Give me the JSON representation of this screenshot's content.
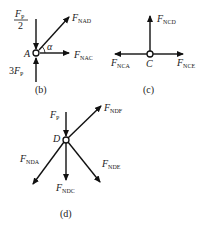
{
  "diagrams": [
    {
      "id": "b",
      "caption": "(b)",
      "node": {
        "label": "A"
      },
      "forces": [
        {
          "name": "F_P/2",
          "main": "F",
          "sub": "P",
          "numerator": "F",
          "numerator_sub": "P",
          "denominator": "2",
          "direction": "down",
          "into_node": true
        },
        {
          "name": "F_NAD",
          "main": "F",
          "sub": "NAD",
          "direction": "up-right",
          "into_node": false
        },
        {
          "name": "F_NAC",
          "main": "F",
          "sub": "NAC",
          "direction": "right",
          "into_node": false
        },
        {
          "name": "3F_P",
          "coef": "3",
          "main": "F",
          "sub": "P",
          "direction": "up",
          "into_node": true
        }
      ],
      "angle_label": "α"
    },
    {
      "id": "c",
      "caption": "(c)",
      "node": {
        "label": "C"
      },
      "forces": [
        {
          "name": "F_NCD",
          "main": "F",
          "sub": "NCD",
          "direction": "up"
        },
        {
          "name": "F_NCA",
          "main": "F",
          "sub": "NCA",
          "direction": "left"
        },
        {
          "name": "F_NCE",
          "main": "F",
          "sub": "NCE",
          "direction": "right"
        }
      ]
    },
    {
      "id": "d",
      "caption": "(d)",
      "node": {
        "label": "D"
      },
      "forces": [
        {
          "name": "F_P",
          "main": "F",
          "sub": "P",
          "direction": "down",
          "into_node": true
        },
        {
          "name": "F_NDF",
          "main": "F",
          "sub": "NDF",
          "direction": "up-right"
        },
        {
          "name": "F_NDA",
          "main": "F",
          "sub": "NDA",
          "direction": "down-left"
        },
        {
          "name": "F_NDC",
          "main": "F",
          "sub": "NDC",
          "direction": "down"
        },
        {
          "name": "F_NDE",
          "main": "F",
          "sub": "NDE",
          "direction": "down-right"
        }
      ]
    }
  ],
  "colors": {
    "stroke": "#111111",
    "background": "#ffffff"
  }
}
